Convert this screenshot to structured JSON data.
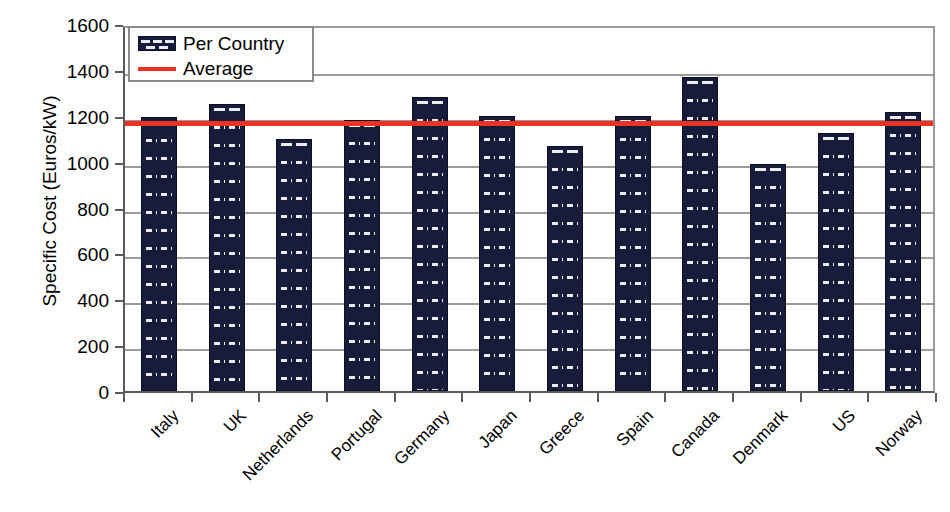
{
  "chart_data": {
    "type": "bar",
    "title": "",
    "xlabel": "",
    "ylabel": "Specific Cost (Euros/kW)",
    "ylim": [
      0,
      1600
    ],
    "ytick_step": 200,
    "yticks": [
      "1600",
      "1400",
      "1200",
      "1000",
      "800",
      "600",
      "400",
      "200",
      "0"
    ],
    "grid": true,
    "categories": [
      "Italy",
      "UK",
      "Netherlands",
      "Portugal",
      "Germany",
      "Japan",
      "Greece",
      "Spain",
      "Canada",
      "Denmark",
      "US",
      "Norway"
    ],
    "values": [
      1195,
      1250,
      1100,
      1180,
      1280,
      1200,
      1070,
      1200,
      1370,
      990,
      1125,
      1215
    ],
    "series": [
      {
        "name": "Per Country",
        "values": [
          1195,
          1250,
          1100,
          1180,
          1280,
          1200,
          1070,
          1200,
          1370,
          990,
          1125,
          1215
        ]
      },
      {
        "name": "Average",
        "type": "hline",
        "value": 1185
      }
    ],
    "legend": {
      "position": "top-left",
      "entries": [
        {
          "label": "Per Country",
          "marker": "bar-pattern-swatch",
          "color": "#171c3a"
        },
        {
          "label": "Average",
          "marker": "line",
          "color": "#ea3323"
        }
      ]
    },
    "colors": {
      "bar_fill": "#171c3a",
      "bar_hatch": "#e9ecf5",
      "average_line": "#ea3323",
      "grid": "#9a9a9a",
      "axis": "#5a5a5a",
      "background": "#ffffff"
    }
  }
}
